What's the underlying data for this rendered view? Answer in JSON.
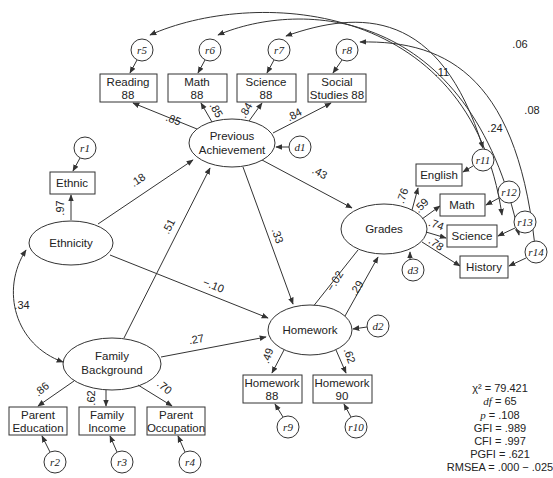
{
  "latent": {
    "prev_ach": {
      "line1": "Previous",
      "line2": "Achievement"
    },
    "ethnicity": "Ethnicity",
    "family_bg": {
      "line1": "Family",
      "line2": "Background"
    },
    "homework": "Homework",
    "grades": "Grades"
  },
  "observed": {
    "reading": {
      "line1": "Reading",
      "line2": "88"
    },
    "math88": {
      "line1": "Math",
      "line2": "88"
    },
    "science88": {
      "line1": "Science",
      "line2": "88"
    },
    "social88": {
      "line1": "Social",
      "line2": "Studies 88"
    },
    "ethnic": "Ethnic",
    "english": "English",
    "math": "Math",
    "science": "Science",
    "history": "History",
    "hw88": {
      "line1": "Homework",
      "line2": "88"
    },
    "hw90": {
      "line1": "Homework",
      "line2": "90"
    },
    "parent_ed": {
      "line1": "Parent",
      "line2": "Education"
    },
    "family_inc": {
      "line1": "Family",
      "line2": "Income"
    },
    "parent_occ": {
      "line1": "Parent",
      "line2": "Occupation"
    }
  },
  "errors": {
    "r1": "r1",
    "r2": "r2",
    "r3": "r3",
    "r4": "r4",
    "r5": "r5",
    "r6": "r6",
    "r7": "r7",
    "r8": "r8",
    "r9": "r9",
    "r10": "r10",
    "r11": "r11",
    "r12": "r12",
    "r13": "r13",
    "r14": "r14",
    "d1": "d1",
    "d2": "d2",
    "d3": "d3"
  },
  "paths": {
    "pa_reading": ".85",
    "pa_math": ".85",
    "pa_science": ".84",
    "pa_social": ".84",
    "eth_ethnic": ".97",
    "eth_pa": ".18",
    "eth_hw": "−.10",
    "fb_pa": ".51",
    "fb_hw": ".27",
    "fb_eth": ".34",
    "pa_grades": ".43",
    "pa_hw": ".33",
    "grades_hw": "−.02",
    "hw_grades": ".29",
    "gr_english": ".76",
    "gr_math": ".59",
    "gr_science": ".74",
    "gr_history": ".78",
    "hw_hw88": ".49",
    "hw_hw90": ".62",
    "fb_pe": ".86",
    "fb_fi": ".62",
    "fb_po": ".70",
    "cov_011": ".11",
    "cov_006": ".06",
    "cov_024": ".24",
    "cov_008": ".08"
  },
  "fit": {
    "chi2": "χ² = 79.421",
    "df_label": "df",
    "df_value": " = 65",
    "p_label": "p",
    "p_value": " = .108",
    "gfi": "GFI = .989",
    "cfi": "CFI = .997",
    "pgfi": "PGFI = .621",
    "rmsea": "RMSEA = .000 − .025"
  }
}
